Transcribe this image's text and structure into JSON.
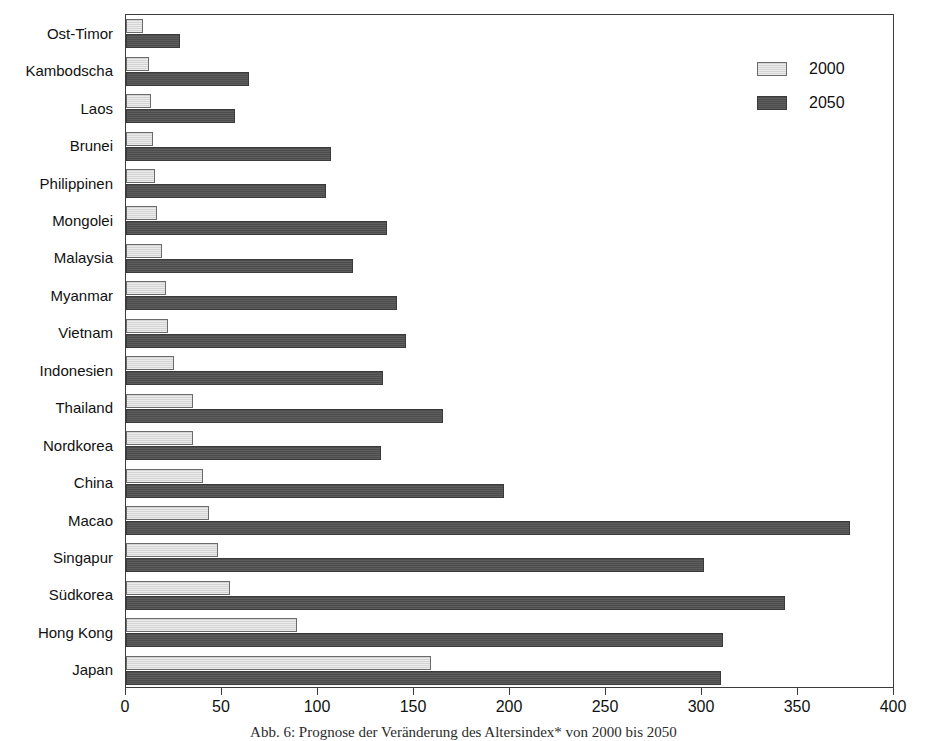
{
  "chart_data": {
    "type": "bar",
    "orientation": "horizontal",
    "title": "",
    "xlabel": "",
    "ylabel": "",
    "xlim": [
      0,
      400
    ],
    "xticks": [
      0,
      50,
      100,
      150,
      200,
      250,
      300,
      350,
      400
    ],
    "xtick_labels": [
      "0",
      "50",
      "100",
      "150",
      "200",
      "250",
      "300",
      "350",
      "400"
    ],
    "grid": false,
    "legend_position": "top-right",
    "categories": [
      "Ost-Timor",
      "Kambodscha",
      "Laos",
      "Brunei",
      "Philippinen",
      "Mongolei",
      "Malaysia",
      "Myanmar",
      "Vietnam",
      "Indonesien",
      "Thailand",
      "Nordkorea",
      "China",
      "Macao",
      "Singapur",
      "Südkorea",
      "Hong Kong",
      "Japan"
    ],
    "series": [
      {
        "name": "2000",
        "color": "#d4d4d4",
        "values": [
          9,
          12,
          13,
          14,
          15,
          16,
          19,
          21,
          22,
          25,
          35,
          35,
          40,
          43,
          48,
          54,
          89,
          159
        ]
      },
      {
        "name": "2050",
        "color": "#4d4d4d",
        "values": [
          28,
          64,
          57,
          107,
          104,
          136,
          118,
          141,
          146,
          134,
          165,
          133,
          197,
          377,
          301,
          343,
          311,
          310
        ]
      }
    ]
  },
  "legend": {
    "items": [
      {
        "label": "2000",
        "swatch": "light-gray-hatch"
      },
      {
        "label": "2050",
        "swatch": "dark-gray-hatch"
      }
    ]
  },
  "caption": {
    "text": "Abb. 6: Prognose der Veränderung des Altersindex* von 2000 bis 2050"
  }
}
